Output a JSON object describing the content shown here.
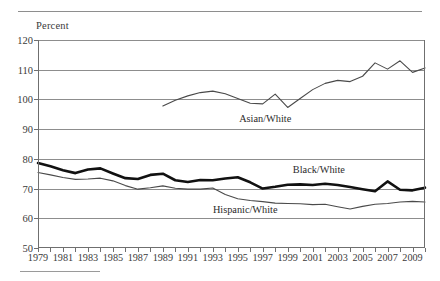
{
  "chart_data": {
    "type": "line",
    "title": "",
    "xlabel": "",
    "ylabel": "Percent",
    "ylim": [
      50,
      120
    ],
    "ytick_step": 10,
    "yticks": [
      50,
      60,
      70,
      80,
      90,
      100,
      110,
      120
    ],
    "xlim": [
      1979,
      2010
    ],
    "xticks": [
      1979,
      1980,
      1981,
      1982,
      1983,
      1984,
      1985,
      1986,
      1987,
      1988,
      1989,
      1990,
      1991,
      1992,
      1993,
      1994,
      1995,
      1996,
      1997,
      1998,
      1999,
      2000,
      2001,
      2002,
      2003,
      2004,
      2005,
      2006,
      2007,
      2008,
      2009,
      2010
    ],
    "xtick_labels": [
      "1979",
      "1981",
      "1983",
      "1985",
      "1987",
      "1989",
      "1991",
      "1993",
      "1995",
      "1997",
      "1999",
      "2001",
      "2003",
      "2005",
      "2007",
      "2009"
    ],
    "grid": true,
    "legend_position": "inline-annotations",
    "series": [
      {
        "name": "Asian/White",
        "style": "thin",
        "color": "#4a4a4a",
        "label_x": 1997.2,
        "label_y": 93.2,
        "x": [
          1989,
          1990,
          1991,
          1992,
          1993,
          1994,
          1995,
          1996,
          1997,
          1998,
          1999,
          2000,
          2001,
          2002,
          2003,
          2004,
          2005,
          2006,
          2007,
          2008,
          2009,
          2010
        ],
        "values": [
          97.8,
          99.7,
          101.2,
          102.3,
          102.8,
          101.9,
          100.3,
          98.7,
          98.5,
          101.8,
          97.3,
          100.3,
          103.3,
          105.4,
          106.4,
          106.0,
          107.8,
          112.3,
          110.2,
          113.0,
          109.1,
          110.6
        ]
      },
      {
        "name": "Black/White",
        "style": "bold",
        "color": "#111111",
        "label_x": 2001.5,
        "label_y": 76.0,
        "x": [
          1979,
          1980,
          1981,
          1982,
          1983,
          1984,
          1985,
          1986,
          1987,
          1988,
          1989,
          1990,
          1991,
          1992,
          1993,
          1994,
          1995,
          1996,
          1997,
          1998,
          1999,
          2000,
          2001,
          2002,
          2003,
          2004,
          2005,
          2006,
          2007,
          2008,
          2009,
          2010
        ],
        "values": [
          78.6,
          77.5,
          76.2,
          75.2,
          76.4,
          76.8,
          75.1,
          73.5,
          73.2,
          74.6,
          75.0,
          72.8,
          72.2,
          72.9,
          72.8,
          73.4,
          73.8,
          72.1,
          70.0,
          70.6,
          71.3,
          71.4,
          71.2,
          71.6,
          71.2,
          70.5,
          69.8,
          69.1,
          72.4,
          69.6,
          69.4,
          70.3
        ]
      },
      {
        "name": "Hispanic/White",
        "style": "thin",
        "color": "#4a4a4a",
        "label_x": 1995.6,
        "label_y": 62.3,
        "x": [
          1979,
          1980,
          1981,
          1982,
          1983,
          1984,
          1985,
          1986,
          1987,
          1988,
          1989,
          1990,
          1991,
          1992,
          1993,
          1994,
          1995,
          1996,
          1997,
          1998,
          1999,
          2000,
          2001,
          2002,
          2003,
          2004,
          2005,
          2006,
          2007,
          2008,
          2009,
          2010
        ],
        "values": [
          75.4,
          74.6,
          73.7,
          73.1,
          73.2,
          73.5,
          72.6,
          71.0,
          69.8,
          70.3,
          70.9,
          70.1,
          69.8,
          69.8,
          70.2,
          68.0,
          66.6,
          66.0,
          65.6,
          65.1,
          65.0,
          64.9,
          64.6,
          64.7,
          63.9,
          63.1,
          64.0,
          64.7,
          65.0,
          65.5,
          65.7,
          65.5
        ]
      }
    ]
  }
}
